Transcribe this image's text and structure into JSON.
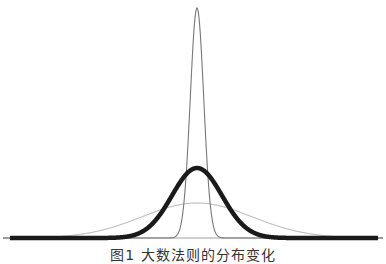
{
  "caption": "图1  大数法则的分布变化",
  "chart_data": {
    "type": "line",
    "title": "",
    "xlabel": "",
    "ylabel": "",
    "grid": false,
    "legend": null,
    "axes_visible": false,
    "x_range": [
      -4,
      4
    ],
    "mean": 0,
    "series": [
      {
        "name": "narrow",
        "sigma": 0.27,
        "style": "thin",
        "color": "#777777",
        "stroke_width": 1.1,
        "peak_px_y": 8
      },
      {
        "name": "medium",
        "sigma": 1.0,
        "style": "thick",
        "color": "#1a1a1a",
        "stroke_width": 4.5,
        "peak_px_y": 168
      },
      {
        "name": "wide",
        "sigma": 2.2,
        "style": "thin",
        "color": "#aaaaaa",
        "stroke_width": 1.0,
        "peak_px_y": 203
      }
    ],
    "baseline": {
      "color": "#888888",
      "stroke_width": 0.8
    }
  },
  "layout": {
    "center_x": 197,
    "baseline_y": 238,
    "x_left": 10,
    "x_right": 378,
    "px_per_unit": 25
  }
}
